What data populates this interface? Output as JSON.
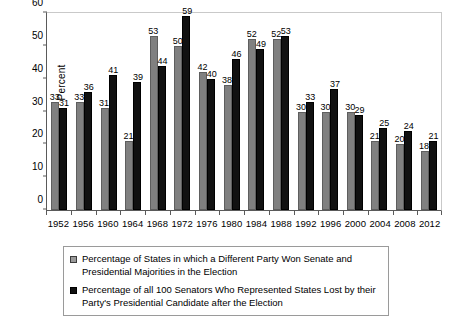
{
  "chart_data": {
    "type": "bar",
    "title": "",
    "subtitle": "",
    "xlabel": "",
    "ylabel": "Percent",
    "ylim": [
      0,
      60
    ],
    "yticks": [
      0,
      10,
      20,
      30,
      40,
      50,
      60
    ],
    "grid": false,
    "legend_position": "bottom",
    "categories": [
      "1952",
      "1956",
      "1960",
      "1964",
      "1968",
      "1972",
      "1976",
      "1980",
      "1984",
      "1988",
      "1992",
      "1996",
      "2000",
      "2004",
      "2008",
      "2012"
    ],
    "series": [
      {
        "name": "Percentage of States in which a Different Party Won Senate and Presidential Majorities in the Election",
        "color": "#808080",
        "values": [
          33,
          33,
          31,
          21,
          53,
          50,
          42,
          38,
          52,
          52,
          30,
          30,
          30,
          21,
          20,
          18
        ]
      },
      {
        "name": "Percentage of all 100 Senators Who Represented States Lost by their Party's Presidential Candidate after the Election",
        "color": "#111111",
        "values": [
          31,
          36,
          41,
          39,
          44,
          59,
          40,
          46,
          49,
          53,
          33,
          37,
          29,
          25,
          24,
          21
        ]
      }
    ]
  },
  "legend": {
    "entries": [
      {
        "line1": "Percentage of States in which a Different Party Won Senate and",
        "line2": "Presidential Majorities in the Election"
      },
      {
        "line1": "Percentage of all 100 Senators Who Represented States Lost by their",
        "line2": "Party's Presidential Candidate after the Election"
      }
    ]
  }
}
